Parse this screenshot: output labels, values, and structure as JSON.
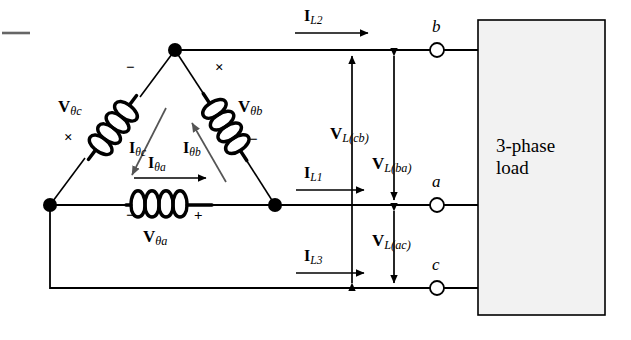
{
  "diagram": {
    "source_type": "delta",
    "colors": {
      "wire": "#000000",
      "node": "#000000",
      "load_fill": "#f2f2f2",
      "load_stroke": "#000000",
      "arrow_gray": "#555555",
      "background": "#ffffff"
    },
    "load_box": {
      "line1": "3-phase",
      "line2": "load"
    },
    "phase_windings": [
      {
        "id": "a",
        "voltage_label_main": "V",
        "voltage_label_sub": "θa",
        "current_label_main": "I",
        "current_label_sub": "θa",
        "polarity_left": "−",
        "polarity_right": "+",
        "position": "bottom"
      },
      {
        "id": "b",
        "voltage_label_main": "V",
        "voltage_label_sub": "θb",
        "current_label_main": "I",
        "current_label_sub": "θb",
        "polarity_top": "×",
        "polarity_bottom": "−",
        "position": "upper-right"
      },
      {
        "id": "c",
        "voltage_label_main": "V",
        "voltage_label_sub": "θc",
        "current_label_main": "I",
        "current_label_sub": "θc",
        "polarity_top": "−",
        "polarity_bottom": "×",
        "position": "upper-left"
      }
    ],
    "line_currents": [
      {
        "id": "IL1",
        "main": "I",
        "sub": "L1",
        "direction": "right",
        "to_terminal": "a"
      },
      {
        "id": "IL2",
        "main": "I",
        "sub": "L2",
        "direction": "right",
        "to_terminal": "b"
      },
      {
        "id": "IL3",
        "main": "I",
        "sub": "L3",
        "direction": "right",
        "to_terminal": "c"
      }
    ],
    "line_voltages": [
      {
        "id": "VLcb",
        "main": "V",
        "sub": "L(cb)",
        "from": "c",
        "to": "b",
        "arrows": "both"
      },
      {
        "id": "VLba",
        "main": "V",
        "sub": "L(ba)",
        "from": "b",
        "to": "a",
        "arrows": "both"
      },
      {
        "id": "VLac",
        "main": "V",
        "sub": "L(ac)",
        "from": "a",
        "to": "c",
        "arrows": "both"
      }
    ],
    "terminals": [
      {
        "id": "b",
        "label": "b"
      },
      {
        "id": "a",
        "label": "a"
      },
      {
        "id": "c",
        "label": "c"
      }
    ]
  }
}
